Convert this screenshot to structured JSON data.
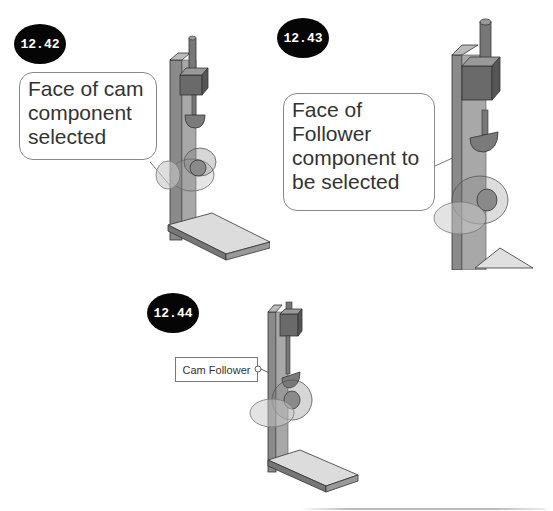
{
  "figures": [
    {
      "id": "fig-1",
      "number": "12.42",
      "callout": "Face of cam component selected",
      "callout_lines": [
        "Face of cam",
        "component",
        "selected"
      ]
    },
    {
      "id": "fig-2",
      "number": "12.43",
      "callout": "Face of Follower component to be selected",
      "callout_lines": [
        "Face of",
        "Follower",
        "component to",
        "be selected"
      ]
    },
    {
      "id": "fig-3",
      "number": "12.44",
      "label": "Cam Follower"
    }
  ],
  "colors": {
    "badge": "#050505",
    "part": "#8a8a8a",
    "part_dark": "#6a6a6a",
    "base": "#d8d8d8",
    "outline": "#333333"
  }
}
